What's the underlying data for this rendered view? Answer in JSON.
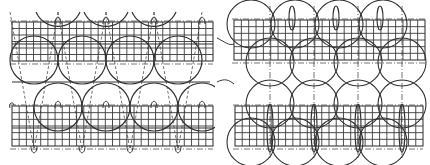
{
  "figure": {
    "colors": {
      "line": "#333333",
      "grid": "#3a3a3a",
      "background": "#ffffff"
    }
  },
  "panels": [
    {
      "id": "left",
      "grids": [
        {
          "x": 12,
          "y": 22,
          "w": 201,
          "h": 39,
          "cols": 28,
          "rows": 6
        },
        {
          "x": 12,
          "y": 106,
          "w": 201,
          "h": 40,
          "cols": 28,
          "rows": 6
        }
      ],
      "circles_row1": {
        "cy": 60,
        "r": 24,
        "cx": [
          34,
          82,
          130,
          178
        ]
      },
      "circles_row2": {
        "cy": 107,
        "r": 24,
        "cx": [
          58,
          106,
          154,
          202
        ]
      },
      "arcs_top": {
        "cy": 26,
        "r": 24,
        "cx": [
          58,
          106,
          154
        ]
      },
      "dash_vertices_top": [
        10,
        58,
        106,
        154,
        202
      ],
      "loops_top": [
        58,
        106,
        154,
        202
      ],
      "loops_bottom": [
        34,
        82,
        130,
        178
      ]
    },
    {
      "id": "right",
      "grids": [
        {
          "x": 19,
          "y": 20,
          "w": 191,
          "h": 40,
          "cols": 26,
          "rows": 6
        },
        {
          "x": 20,
          "y": 106,
          "w": 188,
          "h": 40,
          "cols": 26,
          "rows": 6
        }
      ],
      "circle_rows": [
        {
          "cy": 24,
          "r": 24,
          "cx": [
            36,
            80,
            124,
            168
          ]
        },
        {
          "cy": 62,
          "r": 24,
          "cx": [
            55,
            99,
            143,
            187
          ]
        },
        {
          "cy": 104,
          "r": 24,
          "cx": [
            55,
            99,
            143,
            187
          ]
        },
        {
          "cy": 142,
          "r": 24,
          "cx": [
            36,
            80,
            124,
            168
          ]
        }
      ],
      "dash_columns": [
        55,
        99,
        143,
        187
      ],
      "ellipses_top": [
        77,
        121,
        165
      ],
      "ellipses_bottom": [
        55,
        99,
        143,
        187
      ]
    }
  ]
}
